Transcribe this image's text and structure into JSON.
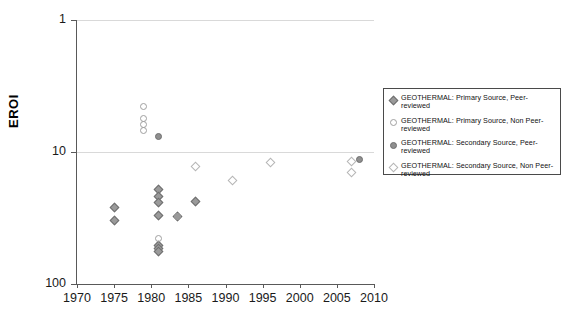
{
  "chart_data": {
    "type": "scatter",
    "title": "",
    "xlabel": "",
    "ylabel": "EROI",
    "xlim": [
      1970,
      2010
    ],
    "ylim": [
      1,
      100
    ],
    "yscale": "log",
    "xticks": [
      1970,
      1975,
      1980,
      1985,
      1990,
      1995,
      2000,
      2005,
      2010
    ],
    "yticks": [
      1,
      10,
      100
    ],
    "grid": "horizontal-gridlines-at-y-ticks",
    "legend_position": "right-outside",
    "series": [
      {
        "name": "GEOTHERMAL: Primary Source, Peer-reviewed",
        "marker": "filled-diamond",
        "color": "#9a9a9a",
        "points": [
          {
            "x": 1975.0,
            "y": 3.8
          },
          {
            "x": 1975.0,
            "y": 3.0
          },
          {
            "x": 1981.0,
            "y": 5.2
          },
          {
            "x": 1981.0,
            "y": 4.6
          },
          {
            "x": 1981.0,
            "y": 4.1
          },
          {
            "x": 1981.0,
            "y": 3.3
          },
          {
            "x": 1981.0,
            "y": 1.95
          },
          {
            "x": 1981.0,
            "y": 1.85
          },
          {
            "x": 1981.0,
            "y": 1.75
          },
          {
            "x": 1983.5,
            "y": 3.2
          },
          {
            "x": 1986.0,
            "y": 4.2
          }
        ]
      },
      {
        "name": "GEOTHERMAL: Primary Source, Non Peer-reviewed",
        "marker": "open-circle",
        "color": "#b5b5b5",
        "points": [
          {
            "x": 1979.0,
            "y": 22.0
          },
          {
            "x": 1979.0,
            "y": 18.0
          },
          {
            "x": 1979.0,
            "y": 16.0
          },
          {
            "x": 1979.0,
            "y": 14.5
          },
          {
            "x": 1981.0,
            "y": 2.2
          },
          {
            "x": 1983.5,
            "y": 3.2
          }
        ]
      },
      {
        "name": "GEOTHERMAL: Secondary Source, Peer-reviewed",
        "marker": "filled-circle",
        "color": "#8f8f8f",
        "points": [
          {
            "x": 1981.0,
            "y": 13.0
          },
          {
            "x": 2008.0,
            "y": 8.7
          }
        ]
      },
      {
        "name": "GEOTHERMAL: Secondary Source, Non Peer-reviewed",
        "marker": "open-diamond",
        "color": "#a0a0a0",
        "points": [
          {
            "x": 1986.0,
            "y": 7.7
          },
          {
            "x": 1991.0,
            "y": 6.1
          },
          {
            "x": 1996.0,
            "y": 8.3
          },
          {
            "x": 2007.0,
            "y": 8.4
          },
          {
            "x": 2007.0,
            "y": 7.0
          }
        ]
      }
    ]
  },
  "axes": {
    "y_title": "EROI",
    "y_tick_labels": [
      "100",
      "10",
      "1"
    ],
    "x_tick_labels": [
      "1970",
      "1975",
      "1980",
      "1985",
      "1990",
      "1995",
      "2000",
      "2005",
      "2010"
    ]
  },
  "legend": {
    "items": [
      {
        "marker": "filled-diamond-icon",
        "label": "GEOTHERMAL: Primary Source, Peer-reviewed"
      },
      {
        "marker": "open-circle-icon",
        "label": "GEOTHERMAL: Primary Source, Non Peer-reviewed"
      },
      {
        "marker": "filled-circle-icon",
        "label": "GEOTHERMAL: Secondary Source, Peer-reviewed"
      },
      {
        "marker": "open-diamond-icon",
        "label": "GEOTHERMAL: Secondary Source, Non Peer-​reviewed"
      }
    ]
  },
  "colors": {
    "axis": "#595959",
    "gridline": "#d9d9d9",
    "text": "#1a1a1a",
    "legend_border": "#4a4a4a"
  }
}
